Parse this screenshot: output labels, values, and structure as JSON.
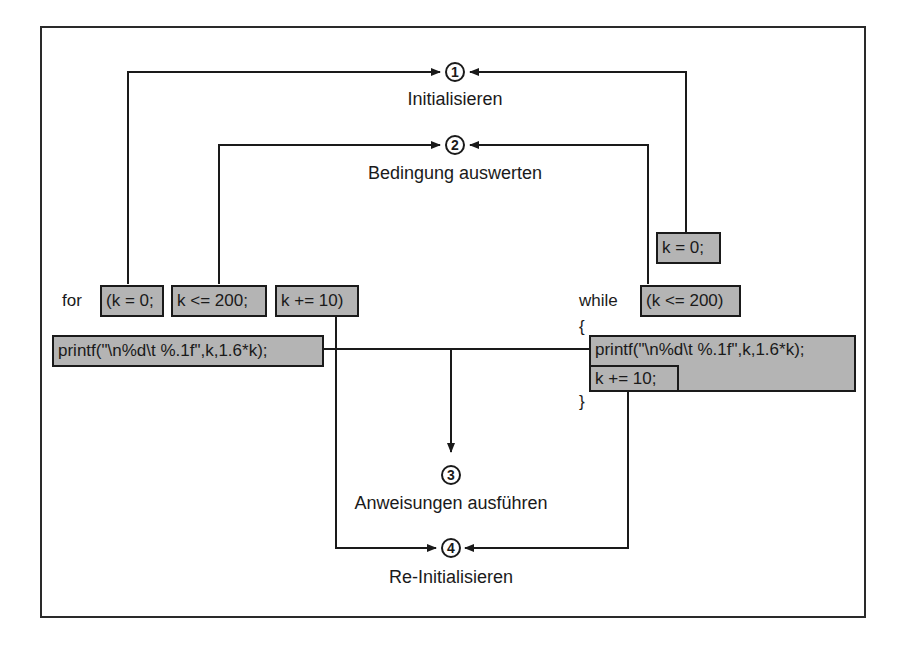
{
  "steps": [
    {
      "num": "1",
      "label": "Initialisieren"
    },
    {
      "num": "2",
      "label": "Bedingung auswerten"
    },
    {
      "num": "3",
      "label": "Anweisungen ausführen"
    },
    {
      "num": "4",
      "label": "Re-Initialisieren"
    }
  ],
  "for_loop": {
    "keyword": "for",
    "init": "(k = 0;",
    "condition": "k <= 200;",
    "increment": "k += 10)",
    "body": "printf(\"\\n%d\\t %.1f\",k,1.6*k);"
  },
  "while_loop": {
    "init": "k = 0;",
    "keyword": "while",
    "condition": "(k <= 200)",
    "open_brace": "{",
    "body": "printf(\"\\n%d\\t %.1f\",k,1.6*k);",
    "increment": "k += 10;",
    "close_brace": "}"
  },
  "colors": {
    "box_fill": "#b4b4b4",
    "line": "#1a1a1a"
  }
}
